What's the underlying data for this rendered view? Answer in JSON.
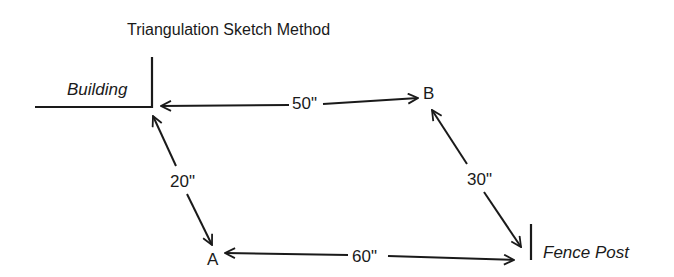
{
  "title": "Triangulation Sketch Method",
  "landmarks": {
    "building": "Building",
    "fence_post": "Fence Post"
  },
  "points": {
    "a": "A",
    "b": "B"
  },
  "measurements": {
    "building_to_b": "50\"",
    "building_to_a": "20\"",
    "b_to_fence_post": "30\"",
    "a_to_fence_post": "60\""
  },
  "colors": {
    "ink": "#1a1a1a",
    "background": "#ffffff"
  }
}
